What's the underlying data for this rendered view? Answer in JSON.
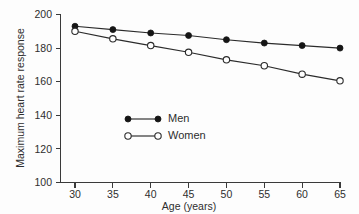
{
  "chart_data": {
    "type": "line",
    "title": "",
    "xlabel": "Age (years)",
    "ylabel": "Maximum heart rate response",
    "x": [
      30,
      35,
      40,
      45,
      50,
      55,
      60,
      65
    ],
    "xticklabels": [
      "30",
      "35",
      "40",
      "45",
      "50",
      "55",
      "60",
      "65"
    ],
    "yticks": [
      100,
      120,
      140,
      160,
      180,
      200
    ],
    "yticklabels": [
      "100",
      "120",
      "140",
      "160",
      "180",
      "200"
    ],
    "xlim": [
      28,
      66
    ],
    "ylim": [
      100,
      200
    ],
    "grid": false,
    "legend_position": "center",
    "series": [
      {
        "name": "Men",
        "marker": "filled-circle",
        "color": "#151515",
        "values": [
          193,
          191,
          189,
          187.5,
          185,
          183,
          181.5,
          180
        ]
      },
      {
        "name": "Women",
        "marker": "open-circle",
        "color": "#2b2b2b",
        "values": [
          190,
          185.5,
          181.5,
          177.5,
          173,
          169.5,
          164.5,
          160.5
        ]
      }
    ]
  },
  "legend": {
    "entries": [
      {
        "label": "Men"
      },
      {
        "label": "Women"
      }
    ]
  }
}
